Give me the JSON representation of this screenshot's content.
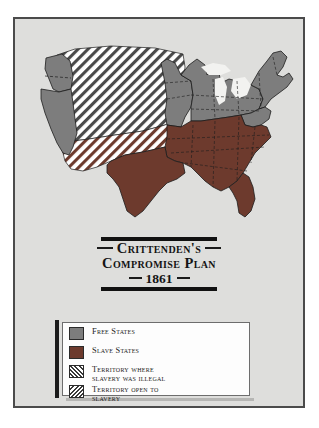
{
  "poster": {
    "background_color": "#dededc",
    "frame_color": "#4b4b4b"
  },
  "title": {
    "line1": "Crittenden's",
    "line2": "Compromise Plan",
    "year": "1861"
  },
  "legend": {
    "items": [
      {
        "label": "Free States",
        "swatch": "solid-gray",
        "color": "#7d7d7d"
      },
      {
        "label": "Slave States",
        "swatch": "solid-brown",
        "color": "#6d3a2d"
      },
      {
        "label": "Territory where\nslavery was illegal",
        "swatch": "hatch-forward",
        "color": "#3a3a3a"
      },
      {
        "label": "Territory open to\nslavery",
        "swatch": "hatch-back",
        "color": "#3a3a3a"
      }
    ]
  },
  "map": {
    "colors": {
      "free_states": "#7d7d7d",
      "slave_states": "#6d3a2d",
      "territory_illegal_hatch": "#4a4a4a",
      "territory_open_hatch": "#6d3a2d",
      "water": "#f2f2f0",
      "outline": "#1d1d1d",
      "state_border": "#1d1d1d"
    },
    "regions": [
      {
        "name": "pacific-free-states",
        "category": "free_states"
      },
      {
        "name": "northern-great-plains-free",
        "category": "free_states"
      },
      {
        "name": "great-lakes-free-states",
        "category": "free_states"
      },
      {
        "name": "northeast-free-states",
        "category": "free_states"
      },
      {
        "name": "northern-territory",
        "category": "territory_illegal"
      },
      {
        "name": "southwest-territory",
        "category": "territory_open"
      },
      {
        "name": "southern-slave-states",
        "category": "slave_states"
      },
      {
        "name": "texas",
        "category": "slave_states"
      },
      {
        "name": "florida",
        "category": "slave_states"
      }
    ]
  }
}
